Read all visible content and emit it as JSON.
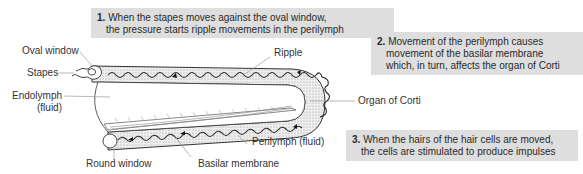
{
  "diagram": {
    "labels": {
      "oval_window": "Oval window",
      "stapes": "Stapes",
      "endolymph_line1": "Endolymph",
      "endolymph_line2": "(fluid)",
      "ripple": "Ripple",
      "organ_of_corti": "Organ of Corti",
      "perilymph": "Perilymph (fluid)",
      "round_window": "Round window",
      "basilar_membrane": "Basilar membrane"
    },
    "notes": [
      {
        "number": "1.",
        "line1": "When the stapes moves against the oval window,",
        "line2": "the pressure starts ripple movements in the perilymph"
      },
      {
        "number": "2.",
        "line1": "Movement of the perilymph causes",
        "line2": "movement of the basilar membrane",
        "line3": "which, in turn, affects the organ of Corti"
      },
      {
        "number": "3.",
        "line1": "When the hairs of the hair cells are moved,",
        "line2": "the cells are stimulated to produce impulses"
      }
    ],
    "colors": {
      "note_background": "#dedede",
      "perilymph_fill": "#e6e6e6",
      "outline": "#333333",
      "leader_line": "#999999"
    }
  }
}
